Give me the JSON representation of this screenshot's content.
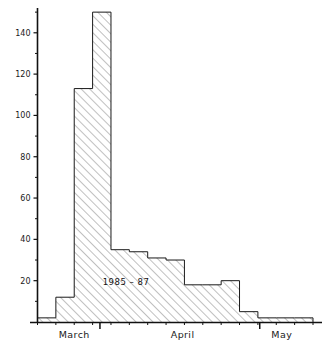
{
  "chart_data": {
    "type": "bar",
    "title": "",
    "subtitle": "",
    "xlabel": "",
    "ylabel": "",
    "annotation": "1985 – 87",
    "grid": false,
    "legend": "none",
    "ylim": [
      0,
      152
    ],
    "xlim": [
      0,
      15
    ],
    "y_ticks_major": [
      20,
      40,
      60,
      80,
      100,
      120,
      140
    ],
    "y_tick_labels": [
      "20",
      "40",
      "60",
      "80",
      "100",
      "120",
      "140"
    ],
    "y_ticks_minor": [
      10,
      30,
      50,
      70,
      90,
      110,
      130,
      150
    ],
    "x_category_labels": [
      "March",
      "April",
      "May"
    ],
    "x_category_label_positions": [
      2.0,
      7.9,
      13.3
    ],
    "x_major_tick_positions": [
      3.4,
      12.1
    ],
    "x_minor_tick_count": 16,
    "bin_edges": [
      0,
      1,
      2,
      3,
      4,
      5,
      6,
      7,
      8,
      9,
      10,
      11,
      12,
      13,
      14,
      15
    ],
    "categories": [
      "b1",
      "b2",
      "b3",
      "b4",
      "b5",
      "b6",
      "b7",
      "b8",
      "b9",
      "b10",
      "b11",
      "b12",
      "b13",
      "b14",
      "b15"
    ],
    "values": [
      2,
      12,
      113,
      150,
      35,
      34,
      31,
      30,
      18,
      18,
      20,
      5,
      2,
      2,
      2
    ],
    "bar_fill": "#ffffff",
    "bar_hatch": "diagonal-45",
    "bar_outline": "#1a1a1a",
    "axis_color": "#111111",
    "background": "#ffffff"
  },
  "axis": {
    "y_labels": [
      "140",
      "120",
      "100",
      "80",
      "60",
      "40",
      "20"
    ],
    "x_labels": [
      "March",
      "April",
      "May"
    ]
  },
  "annotation": {
    "text": "1985 – 87"
  }
}
